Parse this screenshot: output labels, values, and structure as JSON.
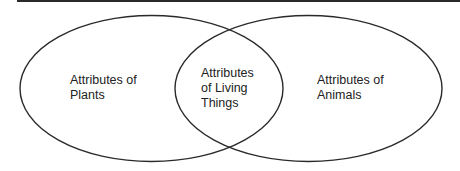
{
  "diagram": {
    "type": "venn",
    "colors": {
      "stroke": "#2a2a2a",
      "text": "#222222",
      "background": "#ffffff"
    },
    "sets": [
      {
        "id": "plants",
        "lines": [
          "Attributes of",
          "Plants"
        ]
      },
      {
        "id": "animals",
        "lines": [
          "Attributes of",
          "Animals"
        ]
      }
    ],
    "intersection": {
      "id": "living-things",
      "lines": [
        "Attributes",
        "of Living",
        "Things"
      ]
    }
  }
}
